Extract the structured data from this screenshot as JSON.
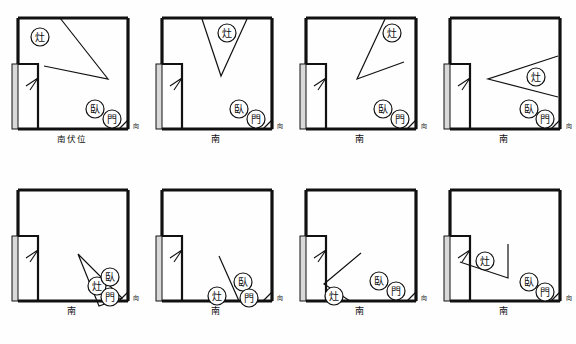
{
  "document": {
    "type": "fengshui-floorplan-sheet",
    "panel_count": 8,
    "columns": 4,
    "rows": 2
  },
  "legend": {
    "stove_label": "灶",
    "bed_label": "臥",
    "door_label": "門",
    "direction_marker": "向"
  },
  "colors": {
    "wall": "#111111",
    "line": "#1a1a1a",
    "balcony_fill": "#d9d9d9",
    "paper": "#fefefe",
    "text": "#111111"
  },
  "panels": [
    {
      "id": "panel-1",
      "caption": "南伏位",
      "sector_label": "伏位",
      "direction": "南",
      "stove": {
        "label": "灶",
        "cx": 40,
        "cy": 37
      },
      "bed": {
        "label": "臥",
        "cx": 95,
        "cy": 109
      },
      "door": {
        "label": "門",
        "cx": 112,
        "cy": 119
      },
      "direction_mark": "向",
      "fan": {
        "shape": "triangle",
        "points": "60,18 62,20 108,79"
      }
    },
    {
      "id": "panel-2",
      "caption": "南",
      "sector_label": "",
      "direction": "南",
      "stove": {
        "label": "灶",
        "cx": 227,
        "cy": 33
      },
      "bed": {
        "label": "臥",
        "cx": 239,
        "cy": 109
      },
      "door": {
        "label": "門",
        "cx": 256,
        "cy": 119
      },
      "direction_mark": "向",
      "fan": {
        "shape": "triangle",
        "points": "202,18 247,19 221,76"
      }
    },
    {
      "id": "panel-3",
      "caption": "南",
      "sector_label": "",
      "direction": "南",
      "stove": {
        "label": "灶",
        "cx": 392,
        "cy": 33
      },
      "bed": {
        "label": "臥",
        "cx": 383,
        "cy": 109
      },
      "door": {
        "label": "門",
        "cx": 400,
        "cy": 119
      },
      "direction_mark": "向",
      "fan": {
        "shape": "triangle",
        "points": "382,18 404,64 357,79"
      }
    },
    {
      "id": "panel-4",
      "caption": "南",
      "sector_label": "",
      "direction": "南",
      "stove": {
        "label": "灶",
        "cx": 529,
        "cy": 77
      },
      "bed": {
        "label": "臥",
        "cx": 527,
        "cy": 109
      },
      "door": {
        "label": "門",
        "cx": 544,
        "cy": 119
      },
      "direction_mark": "向",
      "fan": {
        "shape": "triangle",
        "points": "546,58 546,96 497,79"
      }
    },
    {
      "id": "panel-5",
      "caption": "南",
      "sector_label": "",
      "direction": "南",
      "stove": {
        "label": "灶",
        "cx": 97,
        "cy": 286
      },
      "bed": {
        "label": "臥",
        "cx": 110,
        "cy": 277
      },
      "door": {
        "label": "門",
        "cx": 110,
        "cy": 297
      },
      "direction_mark": "向",
      "fan": {
        "shape": "triangle",
        "points": "78,254 122,298 99,306"
      }
    },
    {
      "id": "panel-6",
      "caption": "南",
      "sector_label": "",
      "direction": "南",
      "stove": {
        "label": "灶",
        "cx": 217,
        "cy": 296
      },
      "bed": {
        "label": "臥",
        "cx": 243,
        "cy": 282
      },
      "door": {
        "label": "門",
        "cx": 249,
        "cy": 298
      },
      "direction_mark": "向",
      "fan": {
        "shape": "triangle",
        "points": "219,256 239,306 199,306"
      }
    },
    {
      "id": "panel-7",
      "caption": "南",
      "sector_label": "",
      "direction": "南",
      "stove": {
        "label": "灶",
        "cx": 334,
        "cy": 296
      },
      "bed": {
        "label": "臥",
        "cx": 379,
        "cy": 281
      },
      "door": {
        "label": "門",
        "cx": 396,
        "cy": 291
      },
      "direction_mark": "向",
      "fan": {
        "shape": "triangle",
        "points": "359,253 324,284 348,306"
      }
    },
    {
      "id": "panel-8",
      "caption": "南",
      "sector_label": "",
      "direction": "南",
      "stove": {
        "label": "灶",
        "cx": 475,
        "cy": 265
      },
      "bed": {
        "label": "臥",
        "cx": 521,
        "cy": 287
      },
      "door": {
        "label": "門",
        "cx": 538,
        "cy": 297
      },
      "direction_mark": "向",
      "fan": {
        "shape": "triangle",
        "points": "500,248 500,280 455,265"
      }
    }
  ]
}
